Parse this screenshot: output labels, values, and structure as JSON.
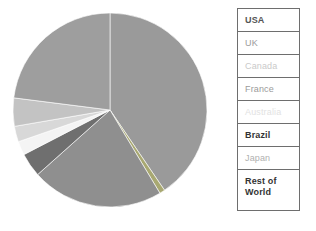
{
  "chart_data": {
    "type": "pie",
    "title": "",
    "categories": [
      "USA",
      "UK",
      "Canada",
      "France",
      "Australia",
      "Brazil",
      "Japan",
      "Rest of World"
    ],
    "values": [
      40.5,
      0.9,
      22.0,
      4.0,
      2.3,
      2.6,
      4.7,
      23.0
    ],
    "colors": [
      "#9a9a9a",
      "#a8a872",
      "#8f8f8f",
      "#6f6f6f",
      "#f4f4f4",
      "#d8d8d8",
      "#c3c3c3",
      "#9e9e9e"
    ],
    "start_angle_deg": 0,
    "direction": "clockwise",
    "legend_position": "right",
    "grid": false,
    "xlabel": "",
    "ylabel": ""
  },
  "legend": {
    "items": [
      {
        "label": "USA",
        "text_color": "#555555",
        "weight": "600"
      },
      {
        "label": "UK",
        "text_color": "#9b9b9b",
        "weight": "400"
      },
      {
        "label": "Canada",
        "text_color": "#cacaca",
        "weight": "400"
      },
      {
        "label": "France",
        "text_color": "#9b9b9b",
        "weight": "400"
      },
      {
        "label": "Australia",
        "text_color": "#e2e2e2",
        "weight": "400"
      },
      {
        "label": "Brazil",
        "text_color": "#333333",
        "weight": "700"
      },
      {
        "label": "Japan",
        "text_color": "#b0b0b0",
        "weight": "400"
      },
      {
        "label": "Rest of\nWorld",
        "text_color": "#333333",
        "weight": "700"
      }
    ],
    "border_color": "#6e6e6e",
    "background": "#ffffff"
  },
  "canvas": {
    "background": "#ffffff",
    "pie_center_x": 110,
    "pie_center_y": 110,
    "pie_radius": 97
  }
}
